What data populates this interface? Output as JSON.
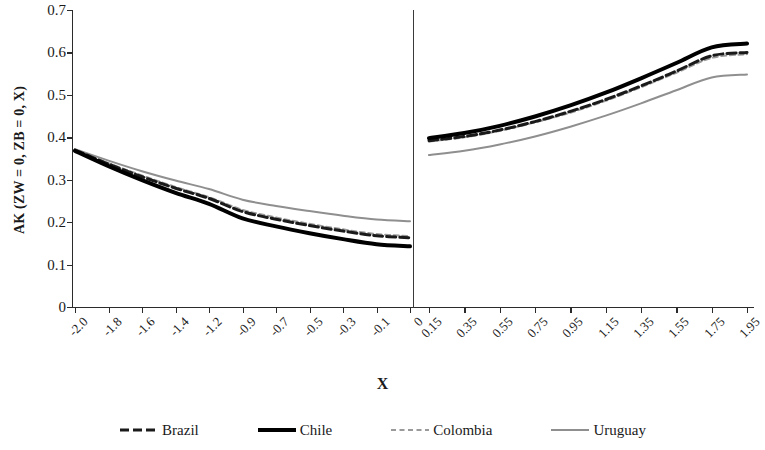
{
  "chart_data": {
    "type": "line",
    "title": "",
    "xlabel": "X",
    "ylabel": "AK (ZW = 0, ZB = 0, X)",
    "ylim": [
      0,
      0.7
    ],
    "yticks": [
      "0",
      "0.1",
      "0.2",
      "0.3",
      "0.4",
      "0.5",
      "0.6",
      "0.7"
    ],
    "ytick_values": [
      0,
      0.1,
      0.2,
      0.3,
      0.4,
      0.5,
      0.6,
      0.7
    ],
    "grid": false,
    "legend_position": "bottom",
    "panels": [
      {
        "name": "left-panel",
        "xticks": [
          "-2.0",
          "-1.8",
          "-1.6",
          "-1.4",
          "-1.2",
          "-0.9",
          "-0.7",
          "-0.5",
          "-0.3",
          "-0.1",
          "0"
        ],
        "x": [
          -2.0,
          -1.8,
          -1.6,
          -1.4,
          -1.2,
          -0.9,
          -0.7,
          -0.5,
          -0.3,
          -0.1,
          0
        ],
        "series": [
          {
            "name": "Brazil",
            "values": [
              0.37,
              0.337,
              0.307,
              0.28,
              0.256,
              0.225,
              0.207,
              0.192,
              0.179,
              0.168,
              0.163
            ]
          },
          {
            "name": "Chile",
            "values": [
              0.368,
              0.332,
              0.299,
              0.269,
              0.243,
              0.209,
              0.19,
              0.174,
              0.16,
              0.148,
              0.143
            ]
          },
          {
            "name": "Colombia",
            "values": [
              0.371,
              0.339,
              0.31,
              0.283,
              0.259,
              0.229,
              0.211,
              0.196,
              0.183,
              0.172,
              0.167
            ]
          },
          {
            "name": "Uruguay",
            "values": [
              0.372,
              0.345,
              0.32,
              0.298,
              0.278,
              0.253,
              0.238,
              0.226,
              0.215,
              0.206,
              0.202
            ]
          }
        ]
      },
      {
        "name": "right-panel",
        "xticks": [
          "0.15",
          "0.35",
          "0.55",
          "0.75",
          "0.95",
          "1.15",
          "1.35",
          "1.55",
          "1.75",
          "1.95"
        ],
        "x": [
          0.15,
          0.35,
          0.55,
          0.75,
          0.95,
          1.15,
          1.35,
          1.55,
          1.75,
          1.95
        ],
        "series": [
          {
            "name": "Brazil",
            "values": [
              0.392,
              0.402,
              0.417,
              0.437,
              0.461,
              0.489,
              0.521,
              0.556,
              0.592,
              0.6
            ]
          },
          {
            "name": "Chile",
            "values": [
              0.398,
              0.41,
              0.427,
              0.449,
              0.475,
              0.505,
              0.539,
              0.575,
              0.612,
              0.621
            ]
          },
          {
            "name": "Colombia",
            "values": [
              0.39,
              0.4,
              0.415,
              0.435,
              0.458,
              0.486,
              0.518,
              0.552,
              0.587,
              0.596
            ]
          },
          {
            "name": "Uruguay",
            "values": [
              0.358,
              0.368,
              0.383,
              0.402,
              0.425,
              0.451,
              0.48,
              0.511,
              0.541,
              0.548
            ]
          }
        ]
      }
    ],
    "legend": [
      {
        "label": "Brazil",
        "color": "#1a1a1a",
        "style": "dashed",
        "width": 3
      },
      {
        "label": "Chile",
        "color": "#000000",
        "style": "solid",
        "width": 4
      },
      {
        "label": "Colombia",
        "color": "#9a9a9a",
        "style": "dashed",
        "width": 2
      },
      {
        "label": "Uruguay",
        "color": "#8f8f8f",
        "style": "solid",
        "width": 2
      }
    ]
  }
}
